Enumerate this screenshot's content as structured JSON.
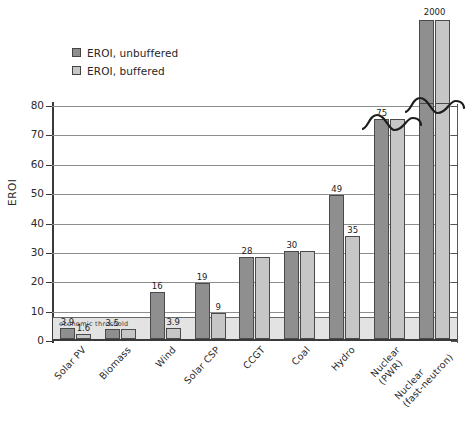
{
  "chart_data": {
    "type": "bar",
    "title": "",
    "subtitle": "",
    "xlabel": "",
    "ylabel": "EROI",
    "ylim": [
      0,
      80
    ],
    "yticks": [
      0,
      10,
      20,
      30,
      40,
      50,
      60,
      70,
      80
    ],
    "grid": true,
    "legend_position": "top-left",
    "axis_break": {
      "present": true,
      "note": "y-axis broken above 80; Nuclear (fast-neutron) bars drawn detached above the break"
    },
    "categories": [
      "Solar PV",
      "Biomass",
      "Wind",
      "Solar CSP",
      "CCGT",
      "Coal",
      "Hydro",
      "Nuclear (PWR)",
      "Nuclear (fast-neutron)"
    ],
    "category_lines": [
      [
        "Solar PV"
      ],
      [
        "Biomass"
      ],
      [
        "Wind"
      ],
      [
        "Solar CSP"
      ],
      [
        "CCGT"
      ],
      [
        "Coal"
      ],
      [
        "Hydro"
      ],
      [
        "Nuclear",
        "(PWR)"
      ],
      [
        "Nuclear",
        "(fast-neutron)"
      ]
    ],
    "series": [
      {
        "name": "EROI, unbuffered",
        "color": "#8f8f8f",
        "values": [
          3.9,
          3.5,
          16,
          19,
          28,
          30,
          49,
          75,
          2000
        ],
        "labels": [
          "3.9",
          "3.5",
          "16",
          "19",
          "28",
          "30",
          "49",
          "75",
          "2000"
        ]
      },
      {
        "name": "EROI, buffered",
        "color": "#c6c6c6",
        "values": [
          1.6,
          3.5,
          3.9,
          9,
          28,
          30,
          35,
          75,
          2000
        ],
        "labels": [
          "1.6",
          "",
          "3.9",
          "9",
          "",
          "",
          "35",
          "",
          ""
        ]
      }
    ],
    "annotations": [
      {
        "name": "economic-threshold",
        "text": "economic threshold",
        "value": 7,
        "style": "shaded band from 0 to 7 with line at top"
      }
    ]
  },
  "legend": {
    "items": [
      {
        "label": "EROI, unbuffered",
        "color": "#8f8f8f"
      },
      {
        "label": "EROI, buffered",
        "color": "#c6c6c6"
      }
    ]
  },
  "axis": {
    "y_title": "EROI",
    "y_tick_labels": [
      "0",
      "10",
      "20",
      "30",
      "40",
      "50",
      "60",
      "70",
      "80"
    ]
  },
  "threshold": {
    "label": "economic threshold"
  }
}
